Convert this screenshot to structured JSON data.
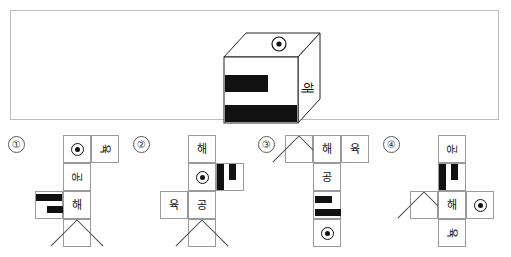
{
  "question": {
    "cube": {
      "top_face_symbol": "dot-symbol",
      "front_face_pattern": "two-horizontal-black-bars",
      "right_face_label": "해"
    }
  },
  "options": [
    {
      "number": "①",
      "cells": [
        {
          "name": "cell-dot",
          "content": "dot-symbol",
          "col": 2,
          "row": 0
        },
        {
          "name": "cell-yuk",
          "content": "육",
          "col": 3,
          "row": 0
        },
        {
          "name": "cell-gong",
          "content": "공",
          "col": 2,
          "row": 1
        },
        {
          "name": "cell-stripes",
          "content": "stripe-pattern",
          "col": 1,
          "row": 2
        },
        {
          "name": "cell-hae",
          "content": "해",
          "col": 2,
          "row": 2
        },
        {
          "name": "cell-x",
          "content": "x-mark",
          "col": 2,
          "row": 3
        }
      ]
    },
    {
      "number": "②",
      "cells": [
        {
          "name": "cell-hae",
          "content": "해",
          "col": 2,
          "row": 0
        },
        {
          "name": "cell-dot",
          "content": "dot-symbol",
          "col": 2,
          "row": 1
        },
        {
          "name": "cell-stripes",
          "content": "stripe-pattern",
          "col": 3,
          "row": 1
        },
        {
          "name": "cell-yuk",
          "content": "육",
          "col": 1,
          "row": 2
        },
        {
          "name": "cell-gong",
          "content": "공",
          "col": 2,
          "row": 2
        },
        {
          "name": "cell-x",
          "content": "x-mark",
          "col": 2,
          "row": 3
        }
      ]
    },
    {
      "number": "③",
      "cells": [
        {
          "name": "cell-x",
          "content": "x-mark",
          "col": 1,
          "row": 0
        },
        {
          "name": "cell-hae",
          "content": "해",
          "col": 2,
          "row": 0
        },
        {
          "name": "cell-yuk",
          "content": "육",
          "col": 3,
          "row": 0
        },
        {
          "name": "cell-gong",
          "content": "공",
          "col": 2,
          "row": 1
        },
        {
          "name": "cell-stripes",
          "content": "stripe-pattern",
          "col": 2,
          "row": 2
        },
        {
          "name": "cell-dot",
          "content": "dot-symbol",
          "col": 2,
          "row": 3
        }
      ]
    },
    {
      "number": "④",
      "cells": [
        {
          "name": "cell-gong",
          "content": "공",
          "col": 2,
          "row": 0
        },
        {
          "name": "cell-stripes",
          "content": "stripe-pattern",
          "col": 2,
          "row": 1
        },
        {
          "name": "cell-x",
          "content": "x-mark",
          "col": 1,
          "row": 2
        },
        {
          "name": "cell-hae",
          "content": "해",
          "col": 2,
          "row": 2
        },
        {
          "name": "cell-dot",
          "content": "dot-symbol",
          "col": 3,
          "row": 2
        },
        {
          "name": "cell-yuk",
          "content": "육",
          "col": 2,
          "row": 3
        }
      ]
    }
  ],
  "labels": {
    "hae": "해",
    "gong": "공",
    "yuk": "육",
    "option1": "①",
    "option2": "②",
    "option3": "③",
    "option4": "④"
  },
  "colors": {
    "ink": "#111111",
    "cell_border": "#9a9a9a",
    "panel_border": "#bdbdbd",
    "background": "#ffffff"
  }
}
